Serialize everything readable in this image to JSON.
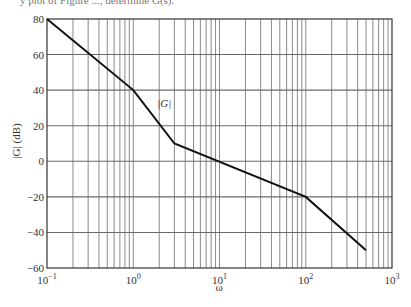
{
  "caption": "y plot of Figure ..., determine G(s).",
  "chart_data": {
    "type": "line",
    "title": "",
    "xlabel": "ω",
    "ylabel": "|G| (dB)",
    "xscale": "log",
    "xlim": [
      0.1,
      1000
    ],
    "ylim": [
      -60,
      80
    ],
    "grid": true,
    "x_tick_labels": [
      "10^-1",
      "10^0",
      "10^1",
      "10^2",
      "10^3"
    ],
    "y_ticks": [
      80,
      60,
      40,
      20,
      0,
      -20,
      -40,
      -60
    ],
    "series": [
      {
        "name": "|G|",
        "x": [
          0.1,
          1,
          3,
          100,
          500
        ],
        "y": [
          80,
          40,
          10,
          -20,
          -50
        ]
      }
    ],
    "annotations": [
      {
        "text": "|G|",
        "x": 2,
        "y": 33
      }
    ],
    "slopes_db_per_decade": [
      -40,
      -60,
      -20,
      -40
    ]
  },
  "labels": {
    "series_label": "|G|",
    "x_axis": "ω",
    "y_axis": "|G| (dB)"
  }
}
